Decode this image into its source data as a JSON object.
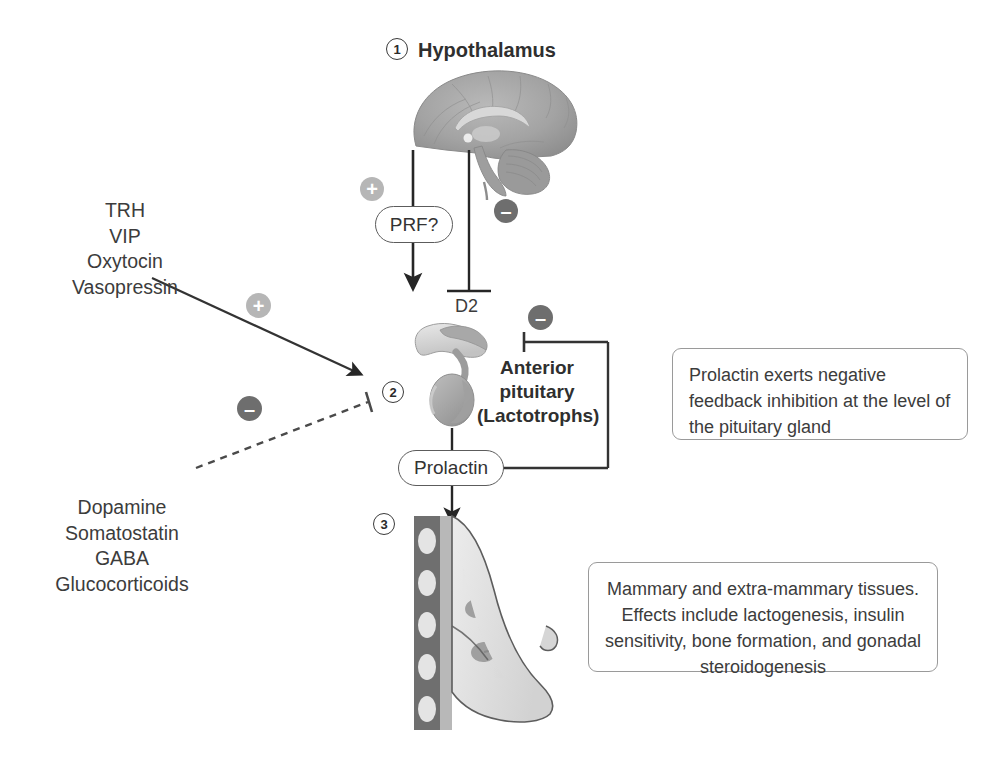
{
  "figure": {
    "background_color": "#ffffff",
    "accent_positive_color": "#b6b6b6",
    "accent_negative_color": "#6e6e6e",
    "line_color": "#333333"
  },
  "steps": {
    "one": "1",
    "two": "2",
    "three": "3"
  },
  "hypothalamus": {
    "title": "Hypothalamus"
  },
  "stimulatory_factors": {
    "text": "TRH\nVIP\nOxytocin\nVasopressin"
  },
  "inhibitory_factors": {
    "text": "Dopamine\nSomatostatin\nGABA\nGlucocorticoids"
  },
  "nodes": {
    "prf": "PRF?",
    "prolactin": "Prolactin"
  },
  "receptor": {
    "d2_label": "D2"
  },
  "pituitary": {
    "label": "Anterior\npituitary\n(Lactotrophs)"
  },
  "signs": {
    "plus": "+",
    "minus": "–"
  },
  "callouts": {
    "feedback": "Prolactin exerts negative feedback inhibition at the level of the pituitary gland",
    "targets": "Mammary and extra-mammary tissues. Effects include lactogenesis, insulin sensitivity, bone formation, and gonadal steroidogenesis"
  },
  "illustrations": {
    "brain": "brain-sagittal-illustration",
    "pituitary": "pituitary-gland-illustration",
    "breast": "breast-cross-section-illustration"
  }
}
